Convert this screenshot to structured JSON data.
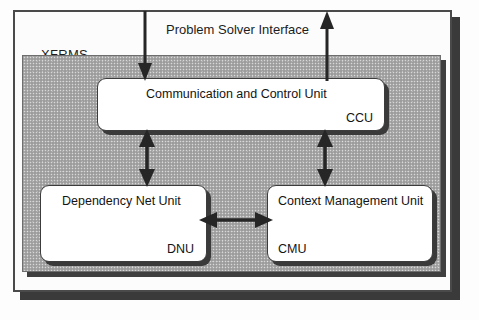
{
  "diagram": {
    "system_label": "XFRMS",
    "interface_label": "Problem Solver Interface",
    "units": [
      {
        "id": "ccu",
        "title": "Communication and Control Unit",
        "acronym": "CCU"
      },
      {
        "id": "dnu",
        "title": "Dependency Net Unit",
        "acronym": "DNU"
      },
      {
        "id": "cmu",
        "title": "Context Management Unit",
        "acronym": "CMU"
      }
    ],
    "connections": [
      {
        "id": "psi-in",
        "icon": "arrow-down-icon",
        "from": "Problem Solver Interface",
        "to": "CCU"
      },
      {
        "id": "psi-out",
        "icon": "arrow-up-icon",
        "from": "CCU",
        "to": "Problem Solver Interface"
      },
      {
        "id": "ccu-dnu",
        "icon": "arrow-updown-icon",
        "from": "CCU",
        "to": "DNU"
      },
      {
        "id": "ccu-cmu",
        "icon": "arrow-updown-icon",
        "from": "CCU",
        "to": "CMU"
      },
      {
        "id": "dnu-cmu",
        "icon": "arrow-leftright-icon",
        "from": "DNU",
        "to": "CMU"
      }
    ],
    "colors": {
      "panel_fill": "#a8a8a8",
      "box_fill": "#ffffff",
      "stroke": "#3c3c3c",
      "shadow": "#3a3a3a",
      "page": "#fdfdfd"
    }
  }
}
